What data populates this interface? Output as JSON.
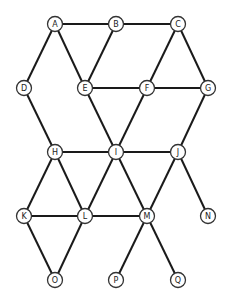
{
  "graph": {
    "node_radius": 7.5,
    "nodes": [
      {
        "id": "A",
        "label": "A",
        "x": 55,
        "y": 24
      },
      {
        "id": "B",
        "label": "B",
        "x": 116,
        "y": 24
      },
      {
        "id": "C",
        "label": "C",
        "x": 178,
        "y": 24
      },
      {
        "id": "D",
        "label": "D",
        "x": 24,
        "y": 88
      },
      {
        "id": "E",
        "label": "E",
        "x": 85,
        "y": 88
      },
      {
        "id": "F",
        "label": "F",
        "x": 147,
        "y": 88
      },
      {
        "id": "G",
        "label": "G",
        "x": 208,
        "y": 88
      },
      {
        "id": "H",
        "label": "H",
        "x": 55,
        "y": 152
      },
      {
        "id": "I",
        "label": "I",
        "x": 116,
        "y": 152
      },
      {
        "id": "J",
        "label": "J",
        "x": 178,
        "y": 152
      },
      {
        "id": "K",
        "label": "K",
        "x": 24,
        "y": 216
      },
      {
        "id": "L",
        "label": "L",
        "x": 85,
        "y": 216
      },
      {
        "id": "M",
        "label": "M",
        "x": 147,
        "y": 216
      },
      {
        "id": "N",
        "label": "N",
        "x": 208,
        "y": 216
      },
      {
        "id": "O",
        "label": "O",
        "x": 55,
        "y": 280
      },
      {
        "id": "P",
        "label": "P",
        "x": 116,
        "y": 280
      },
      {
        "id": "Q",
        "label": "Q",
        "x": 178,
        "y": 280
      }
    ],
    "edges": [
      [
        "A",
        "B"
      ],
      [
        "B",
        "C"
      ],
      [
        "A",
        "D"
      ],
      [
        "A",
        "E"
      ],
      [
        "B",
        "E"
      ],
      [
        "C",
        "F"
      ],
      [
        "C",
        "G"
      ],
      [
        "E",
        "F"
      ],
      [
        "F",
        "G"
      ],
      [
        "D",
        "H"
      ],
      [
        "E",
        "I"
      ],
      [
        "F",
        "I"
      ],
      [
        "G",
        "J"
      ],
      [
        "H",
        "I"
      ],
      [
        "I",
        "J"
      ],
      [
        "H",
        "K"
      ],
      [
        "H",
        "L"
      ],
      [
        "I",
        "L"
      ],
      [
        "I",
        "M"
      ],
      [
        "J",
        "M"
      ],
      [
        "J",
        "N"
      ],
      [
        "K",
        "L"
      ],
      [
        "L",
        "M"
      ],
      [
        "K",
        "O"
      ],
      [
        "L",
        "O"
      ],
      [
        "M",
        "P"
      ],
      [
        "M",
        "Q"
      ]
    ]
  }
}
